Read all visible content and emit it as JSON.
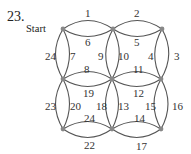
{
  "problem_number": "23.",
  "start_label": "Start",
  "colors": {
    "edge": "#555555",
    "node": "#888888",
    "text": "#333333"
  },
  "nodes": [
    {
      "id": "A",
      "x": 63,
      "y": 29
    },
    {
      "id": "B",
      "x": 113,
      "y": 29
    },
    {
      "id": "C",
      "x": 162,
      "y": 29
    },
    {
      "id": "D",
      "x": 63,
      "y": 79
    },
    {
      "id": "E",
      "x": 112,
      "y": 79
    },
    {
      "id": "F",
      "x": 161,
      "y": 79
    },
    {
      "id": "G",
      "x": 63,
      "y": 129
    },
    {
      "id": "H",
      "x": 112,
      "y": 129
    },
    {
      "id": "I",
      "x": 161,
      "y": 129
    }
  ],
  "edges": [
    {
      "label": "1",
      "from": "A",
      "to": "B",
      "side": "outer"
    },
    {
      "label": "6",
      "from": "A",
      "to": "B",
      "side": "inner"
    },
    {
      "label": "2",
      "from": "B",
      "to": "C",
      "side": "outer"
    },
    {
      "label": "5",
      "from": "B",
      "to": "C",
      "side": "inner"
    },
    {
      "label": "24",
      "from": "A",
      "to": "D",
      "side": "outer"
    },
    {
      "label": "7",
      "from": "A",
      "to": "D",
      "side": "inner"
    },
    {
      "label": "9",
      "from": "B",
      "to": "E",
      "side": "left"
    },
    {
      "label": "10",
      "from": "B",
      "to": "E",
      "side": "right"
    },
    {
      "label": "4",
      "from": "C",
      "to": "F",
      "side": "inner"
    },
    {
      "label": "3",
      "from": "C",
      "to": "F",
      "side": "outer"
    },
    {
      "label": "8",
      "from": "D",
      "to": "E",
      "side": "upper"
    },
    {
      "label": "19",
      "from": "D",
      "to": "E",
      "side": "lower"
    },
    {
      "label": "11",
      "from": "E",
      "to": "F",
      "side": "upper"
    },
    {
      "label": "12",
      "from": "E",
      "to": "F",
      "side": "lower"
    },
    {
      "label": "23",
      "from": "D",
      "to": "G",
      "side": "outer"
    },
    {
      "label": "20",
      "from": "D",
      "to": "G",
      "side": "inner"
    },
    {
      "label": "18",
      "from": "E",
      "to": "H",
      "side": "left"
    },
    {
      "label": "13",
      "from": "E",
      "to": "H",
      "side": "right"
    },
    {
      "label": "15",
      "from": "F",
      "to": "I",
      "side": "inner"
    },
    {
      "label": "16",
      "from": "F",
      "to": "I",
      "side": "outer"
    },
    {
      "label": "24",
      "from": "G",
      "to": "H",
      "side": "inner"
    },
    {
      "label": "22",
      "from": "G",
      "to": "H",
      "side": "outer"
    },
    {
      "label": "14",
      "from": "H",
      "to": "I",
      "side": "inner"
    },
    {
      "label": "17",
      "from": "H",
      "to": "I",
      "side": "outer"
    }
  ],
  "labels": {
    "e1": "1",
    "e2": "2",
    "e3": "3",
    "e4": "4",
    "e5": "5",
    "e6": "6",
    "e7": "7",
    "e8": "8",
    "e9": "9",
    "e10": "10",
    "e11": "11",
    "e12": "12",
    "e13": "13",
    "e14": "14",
    "e15": "15",
    "e16": "16",
    "e17": "17",
    "e18": "18",
    "e19": "19",
    "e20": "20",
    "e22": "22",
    "e23": "23",
    "e24a": "24",
    "e24b": "24"
  }
}
